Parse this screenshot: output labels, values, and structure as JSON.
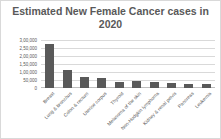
{
  "chart_data": {
    "type": "bar",
    "title": "Estimated New Female Cancer cases in 2020",
    "xlabel": "",
    "ylabel": "",
    "ylim": [
      0,
      300000
    ],
    "yticks": [
      "3,00,000",
      "2,50,000",
      "2,00,000",
      "1,50,000",
      "1,00,000",
      "50,000",
      "0"
    ],
    "grid": true,
    "legend": "none",
    "categories": [
      "Breast",
      "Lung & bronchus",
      "Colon & rectum",
      "Uterine corpus",
      "Thyroid",
      "Melanoma of the skin",
      "Non-Hodgkin lymphoma",
      "Kidney & renal pelvis",
      "Pancreas",
      "Leukemia"
    ],
    "values": [
      276480,
      112520,
      69650,
      65620,
      40170,
      42470,
      34860,
      28230,
      27200,
      25060
    ],
    "bar_color": "#595959"
  },
  "title_line1": "Estimated New Female Cancer cases in",
  "title_line2": "2020"
}
